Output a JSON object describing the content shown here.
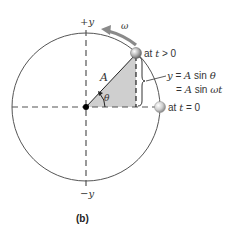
{
  "figure": {
    "caption": "(b)",
    "axis_labels": {
      "pos_y": "+y",
      "neg_y": "−y"
    },
    "amplitude_label": "A",
    "angle_label": "θ",
    "angular_velocity_label": "ω",
    "ball_top_label_prefix": "at ",
    "ball_top_label_var": "t",
    "ball_top_label_suffix": " > 0",
    "ball_right_label_prefix": "at ",
    "ball_right_label_var": "t",
    "ball_right_label_suffix": " = 0",
    "equation_line1_var": "y",
    "equation_line1_rest_a": " = ",
    "equation_line1_A": "A",
    "equation_line1_sin": " sin ",
    "equation_line1_theta": "θ",
    "equation_line2_eq": "= ",
    "equation_line2_A": "A",
    "equation_line2_sin": " sin ",
    "equation_line2_wt": "ωt"
  },
  "colors": {
    "circle": "#555555",
    "axes": "#555555",
    "triangle_fill": "#cfcfcf",
    "omega_arrow": "#8a8a8a",
    "ball": "#9a9a9a",
    "center_dot": "#000000"
  }
}
